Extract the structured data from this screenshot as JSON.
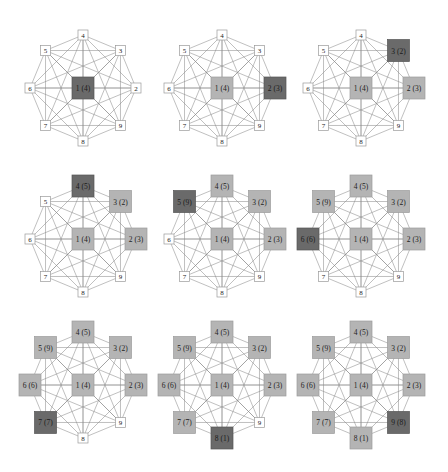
{
  "diagram": {
    "type": "complete-graph-traversal-sequence",
    "colors": {
      "current": "#6a6a6a",
      "visited": "#b4b4b4",
      "unvisited": "#ffffff",
      "edge": "#8c8c8c"
    },
    "layout": {
      "columns": [
        83,
        222,
        361
      ],
      "rows": [
        88,
        239,
        385
      ],
      "radius": 53,
      "node_angles_deg": {
        "2": 0,
        "3": -45,
        "4": -90,
        "5": -135,
        "6": 180,
        "7": 135,
        "8": 90,
        "9": 45
      }
    },
    "final_labels": {
      "1": "1 (4)",
      "2": "2 (3)",
      "3": "3 (2)",
      "4": "4 (5)",
      "5": "5 (9)",
      "6": "6 (6)",
      "7": "7 (7)",
      "8": "8 (1)",
      "9": "9 (8)"
    },
    "panels": [
      {
        "index": 1,
        "current": "1",
        "visited": [],
        "labels": {
          "1": "1 (4)",
          "2": "2",
          "3": "3",
          "4": "4",
          "5": "5",
          "6": "6",
          "7": "7",
          "8": "8",
          "9": "9"
        }
      },
      {
        "index": 2,
        "current": "2",
        "visited": [
          "1"
        ],
        "labels": {
          "1": "1 (4)",
          "2": "2 (3)",
          "3": "3",
          "4": "4",
          "5": "5",
          "6": "6",
          "7": "7",
          "8": "8",
          "9": "9"
        }
      },
      {
        "index": 3,
        "current": "3",
        "visited": [
          "1",
          "2"
        ],
        "labels": {
          "1": "1 (4)",
          "2": "2 (3)",
          "3": "3 (2)",
          "4": "4",
          "5": "5",
          "6": "6",
          "7": "7",
          "8": "8",
          "9": "9"
        }
      },
      {
        "index": 4,
        "current": "4",
        "visited": [
          "1",
          "2",
          "3"
        ],
        "labels": {
          "1": "1 (4)",
          "2": "2 (3)",
          "3": "3 (2)",
          "4": "4 (5)",
          "5": "5",
          "6": "6",
          "7": "7",
          "8": "8",
          "9": "9"
        }
      },
      {
        "index": 5,
        "current": "5",
        "visited": [
          "1",
          "2",
          "3",
          "4"
        ],
        "labels": {
          "1": "1 (4)",
          "2": "2 (3)",
          "3": "3 (2)",
          "4": "4 (5)",
          "5": "5 (9)",
          "6": "6",
          "7": "7",
          "8": "8",
          "9": "9"
        }
      },
      {
        "index": 6,
        "current": "6",
        "visited": [
          "1",
          "2",
          "3",
          "4",
          "5"
        ],
        "labels": {
          "1": "1 (4)",
          "2": "2 (3)",
          "3": "3 (2)",
          "4": "4 (5)",
          "5": "5 (9)",
          "6": "6 (6)",
          "7": "7",
          "8": "8",
          "9": "9"
        }
      },
      {
        "index": 7,
        "current": "7",
        "visited": [
          "1",
          "2",
          "3",
          "4",
          "5",
          "6"
        ],
        "labels": {
          "1": "1 (4)",
          "2": "2 (3)",
          "3": "3 (2)",
          "4": "4 (5)",
          "5": "5 (9)",
          "6": "6 (6)",
          "7": "7 (7)",
          "8": "8",
          "9": "9"
        }
      },
      {
        "index": 8,
        "current": "8",
        "visited": [
          "1",
          "2",
          "3",
          "4",
          "5",
          "6",
          "7"
        ],
        "labels": {
          "1": "1 (4)",
          "2": "2 (3)",
          "3": "3 (2)",
          "4": "4 (5)",
          "5": "5 (9)",
          "6": "6 (6)",
          "7": "7 (7)",
          "8": "8 (1)",
          "9": "9"
        }
      },
      {
        "index": 9,
        "current": "9",
        "visited": [
          "1",
          "2",
          "3",
          "4",
          "5",
          "6",
          "7",
          "8"
        ],
        "labels": {
          "1": "1 (4)",
          "2": "2 (3)",
          "3": "3 (2)",
          "4": "4 (5)",
          "5": "5 (9)",
          "6": "6 (6)",
          "7": "7 (7)",
          "8": "8 (1)",
          "9": "9 (8)"
        }
      }
    ]
  }
}
